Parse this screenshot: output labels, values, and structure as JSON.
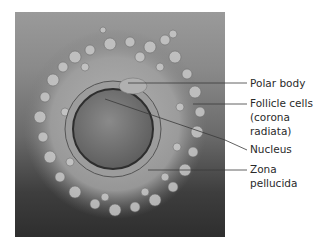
{
  "figure": {
    "colors": {
      "background": "#ffffff",
      "label_text": "#2a2a2a",
      "leader_line": "#3a3a3a"
    },
    "labels": [
      {
        "id": "polar-body",
        "text": "Polar body",
        "y": 78
      },
      {
        "id": "follicle-cells",
        "text": "Follicle cells",
        "y": 98
      },
      {
        "id": "follicle-cells-2",
        "text": "(corona",
        "y": 112
      },
      {
        "id": "follicle-cells-3",
        "text": "radiata)",
        "y": 126
      },
      {
        "id": "nucleus",
        "text": "Nucleus",
        "y": 144
      },
      {
        "id": "zona-pellucida",
        "text": "Zona",
        "y": 164
      },
      {
        "id": "zona-pellucida-2",
        "text": "pellucida",
        "y": 178
      }
    ]
  }
}
